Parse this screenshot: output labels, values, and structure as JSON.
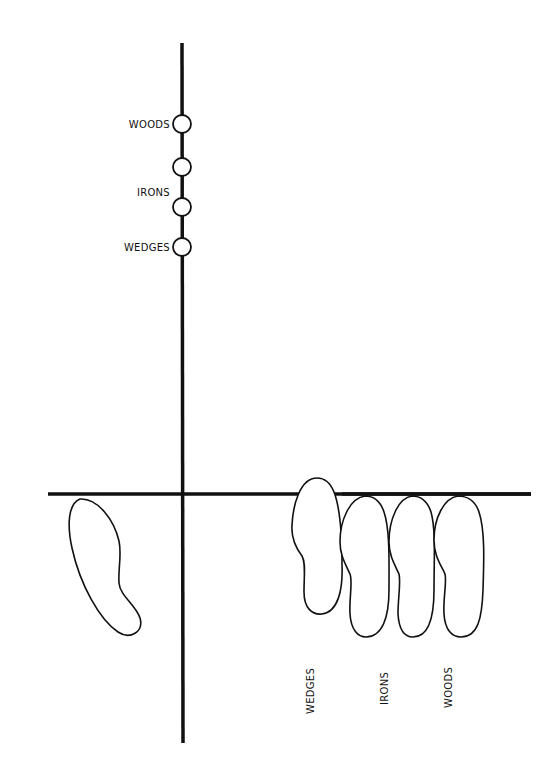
{
  "diagram": {
    "type": "golf-stance-ball-position",
    "colors": {
      "ink": "#111111",
      "background": "#ffffff"
    },
    "ball_positions": [
      {
        "label": "WOODS",
        "y": 124
      },
      {
        "label": "",
        "y": 167
      },
      {
        "label": "IRONS",
        "y": 207
      },
      {
        "label": "WEDGES",
        "y": 247
      }
    ],
    "foot_labels": [
      "WEDGES",
      "IRONS",
      "WOODS"
    ]
  }
}
